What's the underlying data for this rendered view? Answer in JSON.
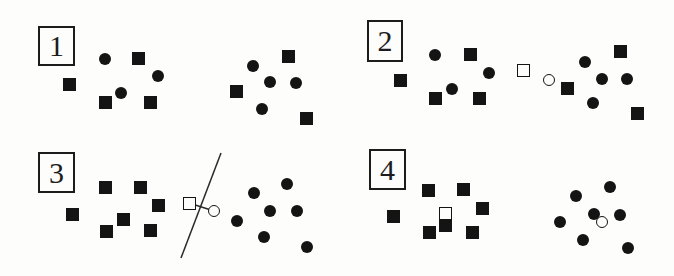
{
  "canvas": {
    "width": 674,
    "height": 276,
    "background": "#fdfdfc"
  },
  "colors": {
    "shape": "#141414",
    "box_border": "#1c1c1c",
    "line": "#2a2a2a"
  },
  "sizes": {
    "filled-square": 13,
    "filled-circle": 12,
    "open-square": 13,
    "open-circle": 12
  },
  "panels": [
    {
      "id": 1,
      "label": "1",
      "label_box": {
        "x": 38,
        "y": 26,
        "w": 37,
        "h": 40
      },
      "shapes": [
        {
          "type": "filled-circle",
          "x": 105,
          "y": 59
        },
        {
          "type": "filled-square",
          "x": 138,
          "y": 58
        },
        {
          "type": "filled-circle",
          "x": 158,
          "y": 76
        },
        {
          "type": "filled-square",
          "x": 69,
          "y": 84
        },
        {
          "type": "filled-circle",
          "x": 121,
          "y": 93
        },
        {
          "type": "filled-square",
          "x": 105,
          "y": 102
        },
        {
          "type": "filled-square",
          "x": 150,
          "y": 102
        },
        {
          "type": "filled-square",
          "x": 288,
          "y": 56
        },
        {
          "type": "filled-circle",
          "x": 253,
          "y": 66
        },
        {
          "type": "filled-circle",
          "x": 270,
          "y": 82
        },
        {
          "type": "filled-circle",
          "x": 296,
          "y": 83
        },
        {
          "type": "filled-square",
          "x": 236,
          "y": 91
        },
        {
          "type": "filled-circle",
          "x": 262,
          "y": 109
        },
        {
          "type": "filled-square",
          "x": 306,
          "y": 118
        }
      ],
      "lines": []
    },
    {
      "id": 2,
      "label": "2",
      "label_box": {
        "x": 367,
        "y": 20,
        "w": 36,
        "h": 42
      },
      "shapes": [
        {
          "type": "filled-circle",
          "x": 435,
          "y": 55
        },
        {
          "type": "filled-square",
          "x": 470,
          "y": 54
        },
        {
          "type": "filled-circle",
          "x": 489,
          "y": 73
        },
        {
          "type": "filled-square",
          "x": 400,
          "y": 80
        },
        {
          "type": "filled-circle",
          "x": 452,
          "y": 89
        },
        {
          "type": "filled-square",
          "x": 435,
          "y": 98
        },
        {
          "type": "filled-square",
          "x": 479,
          "y": 98
        },
        {
          "type": "open-square",
          "x": 523,
          "y": 70
        },
        {
          "type": "open-circle",
          "x": 549,
          "y": 80
        },
        {
          "type": "filled-square",
          "x": 620,
          "y": 51
        },
        {
          "type": "filled-circle",
          "x": 585,
          "y": 62
        },
        {
          "type": "filled-circle",
          "x": 602,
          "y": 79
        },
        {
          "type": "filled-circle",
          "x": 627,
          "y": 79
        },
        {
          "type": "filled-square",
          "x": 567,
          "y": 88
        },
        {
          "type": "filled-circle",
          "x": 593,
          "y": 103
        },
        {
          "type": "filled-square",
          "x": 637,
          "y": 113
        }
      ],
      "lines": []
    },
    {
      "id": 3,
      "label": "3",
      "label_box": {
        "x": 38,
        "y": 152,
        "w": 37,
        "h": 41
      },
      "shapes": [
        {
          "type": "filled-square",
          "x": 105,
          "y": 187
        },
        {
          "type": "filled-square",
          "x": 140,
          "y": 187
        },
        {
          "type": "filled-square",
          "x": 158,
          "y": 205
        },
        {
          "type": "filled-square",
          "x": 72,
          "y": 214
        },
        {
          "type": "filled-square",
          "x": 123,
          "y": 219
        },
        {
          "type": "filled-square",
          "x": 106,
          "y": 231
        },
        {
          "type": "filled-square",
          "x": 150,
          "y": 230
        },
        {
          "type": "open-square",
          "x": 189,
          "y": 203
        },
        {
          "type": "open-circle",
          "x": 214,
          "y": 211
        },
        {
          "type": "filled-circle",
          "x": 287,
          "y": 184
        },
        {
          "type": "filled-circle",
          "x": 254,
          "y": 193
        },
        {
          "type": "filled-circle",
          "x": 270,
          "y": 211
        },
        {
          "type": "filled-circle",
          "x": 297,
          "y": 211
        },
        {
          "type": "filled-circle",
          "x": 237,
          "y": 221
        },
        {
          "type": "filled-circle",
          "x": 264,
          "y": 237
        },
        {
          "type": "filled-circle",
          "x": 307,
          "y": 247
        }
      ],
      "lines": [
        {
          "name": "decision-boundary-line",
          "x1": 221,
          "y1": 153,
          "x2": 181,
          "y2": 258
        },
        {
          "name": "prototype-connector-line",
          "x1": 189,
          "y1": 203,
          "x2": 214,
          "y2": 211
        }
      ]
    },
    {
      "id": 4,
      "label": "4",
      "label_box": {
        "x": 369,
        "y": 149,
        "w": 37,
        "h": 41
      },
      "shapes": [
        {
          "type": "filled-square",
          "x": 428,
          "y": 190
        },
        {
          "type": "filled-square",
          "x": 463,
          "y": 189
        },
        {
          "type": "filled-square",
          "x": 482,
          "y": 208
        },
        {
          "type": "filled-square",
          "x": 393,
          "y": 216
        },
        {
          "type": "open-square",
          "x": 445,
          "y": 213
        },
        {
          "type": "filled-square",
          "x": 445,
          "y": 225
        },
        {
          "type": "filled-square",
          "x": 429,
          "y": 232
        },
        {
          "type": "filled-square",
          "x": 472,
          "y": 232
        },
        {
          "type": "filled-circle",
          "x": 610,
          "y": 187
        },
        {
          "type": "filled-circle",
          "x": 576,
          "y": 196
        },
        {
          "type": "filled-circle",
          "x": 594,
          "y": 214
        },
        {
          "type": "filled-circle",
          "x": 620,
          "y": 215
        },
        {
          "type": "filled-circle",
          "x": 560,
          "y": 222
        },
        {
          "type": "open-circle",
          "x": 602,
          "y": 222
        },
        {
          "type": "filled-circle",
          "x": 583,
          "y": 240
        },
        {
          "type": "filled-circle",
          "x": 628,
          "y": 248
        }
      ],
      "lines": []
    }
  ]
}
